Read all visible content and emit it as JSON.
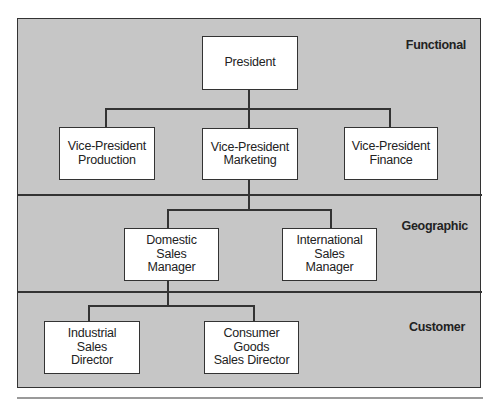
{
  "diagram": {
    "type": "organization-chart",
    "sections": [
      {
        "id": "functional",
        "label": "Functional"
      },
      {
        "id": "geographic",
        "label": "Geographic"
      },
      {
        "id": "customer",
        "label": "Customer"
      }
    ],
    "nodes": {
      "president": "President",
      "vp_production": "Vice-President\nProduction",
      "vp_marketing": "Vice-President\nMarketing",
      "vp_finance": "Vice-President\nFinance",
      "domestic_sales_manager": "Domestic\nSales\nManager",
      "international_sales_manager": "International\nSales\nManager",
      "industrial_sales_director": "Industrial\nSales\nDirector",
      "consumer_goods_sales_director": "Consumer\nGoods\nSales Director"
    },
    "edges": [
      [
        "president",
        "vp_production"
      ],
      [
        "president",
        "vp_marketing"
      ],
      [
        "president",
        "vp_finance"
      ],
      [
        "vp_marketing",
        "domestic_sales_manager"
      ],
      [
        "vp_marketing",
        "international_sales_manager"
      ],
      [
        "domestic_sales_manager",
        "industrial_sales_director"
      ],
      [
        "domestic_sales_manager",
        "consumer_goods_sales_director"
      ]
    ],
    "colors": {
      "background": "#c6c6c6",
      "box": "#ffffff",
      "line": "#333333"
    }
  }
}
